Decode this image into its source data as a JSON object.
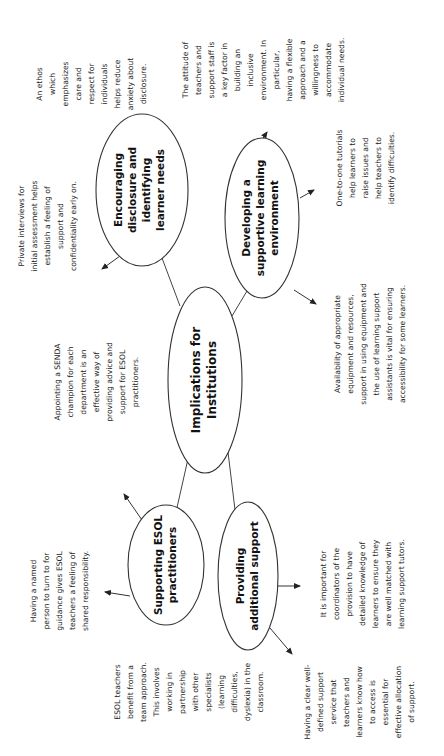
{
  "diagram": {
    "orientation": "rotated -90deg (text reads bottom-to-top)",
    "center": {
      "lines": [
        "Implications for",
        "Institutions"
      ]
    },
    "nodes": [
      {
        "id": "encouraging",
        "lines": [
          "Encouraging",
          "disclosure and",
          "identifying",
          "learner needs"
        ],
        "notes": [
          {
            "id": "private-interviews",
            "lines": [
              "Private interviews for",
              "initial assessment helps",
              "establish a feeling of",
              "support and",
              "confidentiality early on."
            ]
          },
          {
            "id": "ethos",
            "lines": [
              "An ethos",
              "which",
              "emphasizes",
              "care and",
              "respect for",
              "individuals",
              "helps reduce",
              "anxiety about",
              "disclosure."
            ]
          }
        ]
      },
      {
        "id": "developing",
        "lines": [
          "Developing a",
          "supportive learning",
          "environment"
        ],
        "notes": [
          {
            "id": "attitude",
            "lines": [
              "The attitude of",
              "teachers and",
              "support staff is",
              "a key factor in",
              "building an",
              "inclusive",
              "environment. In",
              "particular,",
              "having a flexible",
              "approach and a",
              "willingness to",
              "accommodate",
              "individual needs."
            ]
          },
          {
            "id": "tutorials",
            "lines": [
              "One-to-one tutorials",
              "help learners to",
              "raise issues and",
              "help teachers to",
              "identify difficulties."
            ]
          },
          {
            "id": "equipment",
            "lines": [
              "Availability of appropriate",
              "equipment and resources,",
              "support in using equipment and",
              "the use of learning support",
              "assistants is vital for ensuring",
              "accessibility for some learners."
            ]
          }
        ]
      },
      {
        "id": "supporting",
        "lines": [
          "Supporting ESOL",
          "practitioners"
        ],
        "notes": [
          {
            "id": "senda",
            "lines": [
              "Appointing a SENDA",
              "champion for each",
              "department is an",
              "effective way of",
              "providing advice and",
              "support for ESOL",
              "practitioners."
            ]
          },
          {
            "id": "named-person",
            "lines": [
              "Having a named",
              "person to turn to for",
              "guidance gives ESOL",
              "teachers a feeling of",
              "shared responsibility."
            ]
          },
          {
            "id": "team-approach",
            "lines": [
              "ESOL teachers",
              "benefit from a",
              "team approach.",
              "This involves",
              "working in",
              "partnership",
              "with other",
              "specialists",
              "(learning",
              "difficulties,",
              "dyslexia) in the",
              "classroom."
            ]
          }
        ]
      },
      {
        "id": "providing",
        "lines": [
          "Providing",
          "additional support"
        ],
        "notes": [
          {
            "id": "clear-service",
            "lines": [
              "Having a clear well-",
              "defined support",
              "service that",
              "teachers and",
              "learners know how",
              "to access is",
              "essential for",
              "effective allocation",
              "of support."
            ]
          },
          {
            "id": "coordinators",
            "lines": [
              "It is important for",
              "coordinators of the",
              "provision to have",
              "detailed knowledge of",
              "learners to ensure they",
              "are well matched with",
              "learning support tutors."
            ]
          }
        ]
      }
    ]
  }
}
